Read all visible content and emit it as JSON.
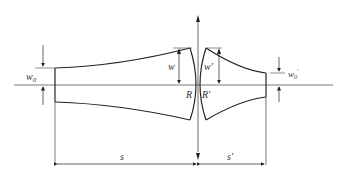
{
  "diagram": {
    "labels": {
      "w0": "w",
      "w0_sub": "0",
      "w": "w",
      "w_prime": "w′",
      "w0_prime": "w",
      "w0_prime_sub": "0",
      "w0_prime_sup": "′",
      "R": "R",
      "R_prime": "R′",
      "s": "s",
      "s_prime": "s′"
    },
    "colors": {
      "stroke": "#222222",
      "axis": "#555555",
      "text": "#333333"
    }
  }
}
